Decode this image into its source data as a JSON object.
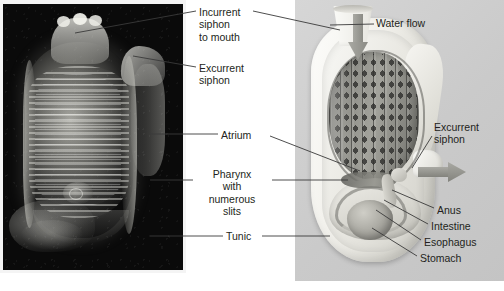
{
  "figure": {
    "text_color": "#231f20",
    "panels": {
      "photo": {
        "name": "tunicate-photograph",
        "background": "#0a0a0a"
      },
      "illustration": {
        "name": "tunicate-cutaway-diagram",
        "background": "#cfcfcf"
      }
    }
  },
  "labels": {
    "incurrent_siphon": "Incurrent\nsiphon\nto mouth",
    "excurrent_siphon": "Excurrent\nsiphon",
    "atrium": "Atrium",
    "pharynx": "Pharynx\nwith\nnumerous\nslits",
    "tunic": "Tunic",
    "water_flow": "Water flow",
    "excurrent_siphon_right": "Excurrent\nsiphon",
    "anus": "Anus",
    "intestine": "Intestine",
    "esophagus": "Esophagus",
    "stomach": "Stomach"
  },
  "structures": {
    "incurrent_siphon": "incurrent-siphon",
    "excurrent_siphon": "excurrent-siphon",
    "pharynx": "pharynx-basket-with-gill-slits",
    "atrium": "atrium-cavity",
    "tunic": "tunic-outer-wall",
    "stomach": "stomach",
    "intestine": "intestine",
    "esophagus": "esophagus",
    "anus": "anus"
  },
  "flow": {
    "incurrent_arrow": "water-flow-in-arrow-down",
    "excurrent_arrow": "water-flow-out-arrow-right",
    "arrow_color": "#8b8b85"
  }
}
